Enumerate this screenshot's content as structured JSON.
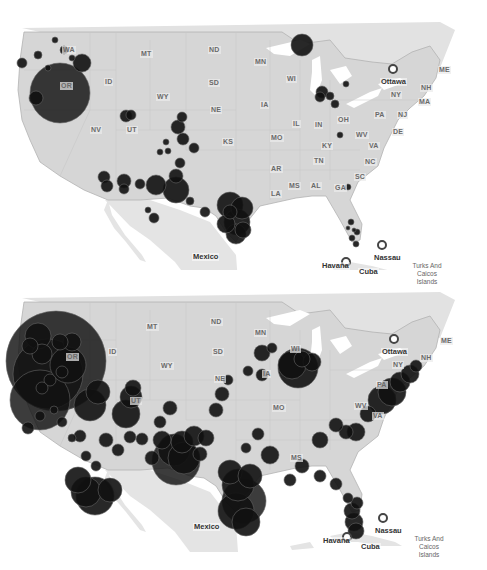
{
  "maps": [
    {
      "id": "top",
      "offset_y": 0,
      "state_labels": [
        {
          "text": "WA",
          "x": 62,
          "y": 46
        },
        {
          "text": "OR",
          "x": 60,
          "y": 82
        },
        {
          "text": "ID",
          "x": 104,
          "y": 78
        },
        {
          "text": "MT",
          "x": 140,
          "y": 50
        },
        {
          "text": "ND",
          "x": 208,
          "y": 46
        },
        {
          "text": "SD",
          "x": 208,
          "y": 79
        },
        {
          "text": "WY",
          "x": 156,
          "y": 93
        },
        {
          "text": "NE",
          "x": 210,
          "y": 106
        },
        {
          "text": "NV",
          "x": 90,
          "y": 126
        },
        {
          "text": "UT",
          "x": 126,
          "y": 126
        },
        {
          "text": "KS",
          "x": 222,
          "y": 138
        },
        {
          "text": "MN",
          "x": 254,
          "y": 58
        },
        {
          "text": "WI",
          "x": 286,
          "y": 75
        },
        {
          "text": "IA",
          "x": 260,
          "y": 101
        },
        {
          "text": "MO",
          "x": 270,
          "y": 134
        },
        {
          "text": "IL",
          "x": 292,
          "y": 120
        },
        {
          "text": "IN",
          "x": 314,
          "y": 121
        },
        {
          "text": "OH",
          "x": 337,
          "y": 116
        },
        {
          "text": "KY",
          "x": 321,
          "y": 142
        },
        {
          "text": "WV",
          "x": 355,
          "y": 131
        },
        {
          "text": "VA",
          "x": 368,
          "y": 142
        },
        {
          "text": "PA",
          "x": 374,
          "y": 111
        },
        {
          "text": "NY",
          "x": 390,
          "y": 91
        },
        {
          "text": "NJ",
          "x": 397,
          "y": 111
        },
        {
          "text": "DE",
          "x": 392,
          "y": 128
        },
        {
          "text": "NH",
          "x": 420,
          "y": 84
        },
        {
          "text": "MA",
          "x": 418,
          "y": 98
        },
        {
          "text": "ME",
          "x": 438,
          "y": 66
        },
        {
          "text": "TN",
          "x": 313,
          "y": 157
        },
        {
          "text": "NC",
          "x": 364,
          "y": 158
        },
        {
          "text": "AR",
          "x": 270,
          "y": 165
        },
        {
          "text": "SC",
          "x": 354,
          "y": 173
        },
        {
          "text": "MS",
          "x": 288,
          "y": 182
        },
        {
          "text": "AL",
          "x": 310,
          "y": 182
        },
        {
          "text": "GA",
          "x": 334,
          "y": 184
        },
        {
          "text": "LA",
          "x": 270,
          "y": 190
        }
      ],
      "places": [
        {
          "text": "Ottawa",
          "x": 380,
          "y": 78,
          "capital": true,
          "cx": 393,
          "cy": 69
        },
        {
          "text": "Mexico",
          "x": 192,
          "y": 253,
          "capital": false
        },
        {
          "text": "Nassau",
          "x": 373,
          "y": 254,
          "capital": true,
          "cx": 382,
          "cy": 245
        },
        {
          "text": "Havana",
          "x": 321,
          "y": 262,
          "capital": true,
          "cx": 346,
          "cy": 262
        },
        {
          "text": "Cuba",
          "x": 358,
          "y": 268,
          "capital": false
        }
      ],
      "note_label": {
        "text": "Turks And Caicos Islands",
        "x": 408,
        "y": 262
      }
    },
    {
      "id": "bottom",
      "offset_y": 290,
      "state_labels": [
        {
          "text": "MT",
          "x": 146,
          "y": 33
        },
        {
          "text": "ND",
          "x": 210,
          "y": 28
        },
        {
          "text": "SD",
          "x": 212,
          "y": 58
        },
        {
          "text": "ID",
          "x": 108,
          "y": 58
        },
        {
          "text": "OR",
          "x": 66,
          "y": 63
        },
        {
          "text": "WY",
          "x": 160,
          "y": 72
        },
        {
          "text": "NE",
          "x": 214,
          "y": 85
        },
        {
          "text": "UT",
          "x": 130,
          "y": 107
        },
        {
          "text": "MN",
          "x": 254,
          "y": 39
        },
        {
          "text": "WI",
          "x": 290,
          "y": 55
        },
        {
          "text": "IA",
          "x": 262,
          "y": 80
        },
        {
          "text": "MO",
          "x": 272,
          "y": 114
        },
        {
          "text": "NY",
          "x": 392,
          "y": 71
        },
        {
          "text": "PA",
          "x": 376,
          "y": 91
        },
        {
          "text": "WV",
          "x": 354,
          "y": 112
        },
        {
          "text": "VA",
          "x": 372,
          "y": 122
        },
        {
          "text": "NH",
          "x": 420,
          "y": 64
        },
        {
          "text": "ME",
          "x": 440,
          "y": 47
        },
        {
          "text": "MS",
          "x": 290,
          "y": 164
        }
      ],
      "places": [
        {
          "text": "Ottawa",
          "x": 381,
          "y": 58,
          "capital": true,
          "cx": 394,
          "cy": 49
        },
        {
          "text": "Mexico",
          "x": 193,
          "y": 233,
          "capital": false
        },
        {
          "text": "Nassau",
          "x": 374,
          "y": 237,
          "capital": true,
          "cx": 383,
          "cy": 228
        },
        {
          "text": "Havana",
          "x": 322,
          "y": 247,
          "capital": true,
          "cx": 347,
          "cy": 247
        },
        {
          "text": "Cuba",
          "x": 360,
          "y": 253,
          "capital": false
        }
      ],
      "note_label": {
        "text": "Turks And Caicos Islands",
        "x": 410,
        "y": 245
      }
    }
  ],
  "colors": {
    "land": "#d6d6d6",
    "land_outline": "#b3b3b3",
    "water": "#ffffff",
    "lakes_canada": "#e2e2e2",
    "mexico_land": "#e4e4e4",
    "bubble": "#111111",
    "bubble_stroke": "#666666"
  },
  "bubbles_top": [
    [
      60,
      93,
      30
    ],
    [
      82,
      63,
      9
    ],
    [
      36,
      98,
      7
    ],
    [
      22,
      63,
      5
    ],
    [
      38,
      55,
      4
    ],
    [
      64,
      50,
      4
    ],
    [
      48,
      68,
      3
    ],
    [
      72,
      58,
      3
    ],
    [
      55,
      40,
      3
    ],
    [
      104,
      177,
      6
    ],
    [
      107,
      186,
      6
    ],
    [
      124,
      181,
      7
    ],
    [
      124,
      189,
      5
    ],
    [
      140,
      184,
      5
    ],
    [
      156,
      185,
      10
    ],
    [
      176,
      190,
      13
    ],
    [
      176,
      176,
      7
    ],
    [
      180,
      163,
      5
    ],
    [
      178,
      127,
      7
    ],
    [
      182,
      117,
      5
    ],
    [
      183,
      139,
      6
    ],
    [
      194,
      148,
      5
    ],
    [
      131,
      115,
      5
    ],
    [
      126,
      116,
      6
    ],
    [
      230,
      205,
      13
    ],
    [
      242,
      208,
      11
    ],
    [
      237,
      222,
      13
    ],
    [
      236,
      234,
      10
    ],
    [
      226,
      224,
      9
    ],
    [
      243,
      230,
      8
    ],
    [
      230,
      212,
      7
    ],
    [
      302,
      45,
      11
    ],
    [
      320,
      97,
      5
    ],
    [
      322,
      92,
      6
    ],
    [
      330,
      96,
      4
    ],
    [
      335,
      104,
      4
    ],
    [
      346,
      84,
      3
    ],
    [
      340,
      135,
      3
    ],
    [
      348,
      187,
      3
    ],
    [
      351,
      222,
      3
    ],
    [
      357,
      232,
      3
    ],
    [
      352,
      238,
      3
    ],
    [
      356,
      244,
      3
    ],
    [
      348,
      228,
      2
    ],
    [
      354,
      230,
      2
    ],
    [
      166,
      142,
      3
    ],
    [
      168,
      151,
      3
    ],
    [
      160,
      152,
      3
    ],
    [
      190,
      201,
      4
    ],
    [
      205,
      212,
      5
    ],
    [
      154,
      218,
      5
    ],
    [
      148,
      210,
      3
    ]
  ],
  "bubbles_bottom": [
    [
      56,
      71,
      50
    ],
    [
      48,
      84,
      35
    ],
    [
      40,
      110,
      30
    ],
    [
      90,
      115,
      16
    ],
    [
      98,
      102,
      12
    ],
    [
      68,
      75,
      18
    ],
    [
      60,
      52,
      8
    ],
    [
      72,
      52,
      9
    ],
    [
      38,
      46,
      13
    ],
    [
      42,
      64,
      10
    ],
    [
      30,
      56,
      8
    ],
    [
      50,
      90,
      6
    ],
    [
      62,
      82,
      6
    ],
    [
      42,
      98,
      6
    ],
    [
      40,
      126,
      5
    ],
    [
      28,
      138,
      6
    ],
    [
      95,
      206,
      19
    ],
    [
      86,
      202,
      15
    ],
    [
      78,
      190,
      13
    ],
    [
      110,
      200,
      12
    ],
    [
      126,
      124,
      14
    ],
    [
      131,
      107,
      11
    ],
    [
      133,
      98,
      8
    ],
    [
      176,
      171,
      24
    ],
    [
      174,
      160,
      16
    ],
    [
      184,
      168,
      16
    ],
    [
      182,
      152,
      11
    ],
    [
      194,
      146,
      10
    ],
    [
      162,
      150,
      9
    ],
    [
      244,
      211,
      22
    ],
    [
      236,
      221,
      18
    ],
    [
      246,
      232,
      14
    ],
    [
      238,
      195,
      16
    ],
    [
      230,
      182,
      12
    ],
    [
      250,
      186,
      12
    ],
    [
      298,
      78,
      20
    ],
    [
      292,
      75,
      14
    ],
    [
      312,
      72,
      9
    ],
    [
      302,
      69,
      8
    ],
    [
      382,
      110,
      14
    ],
    [
      392,
      102,
      14
    ],
    [
      400,
      92,
      10
    ],
    [
      410,
      84,
      9
    ],
    [
      416,
      76,
      6
    ],
    [
      368,
      124,
      8
    ],
    [
      356,
      142,
      9
    ],
    [
      346,
      142,
      7
    ],
    [
      336,
      135,
      7
    ],
    [
      320,
      150,
      8
    ],
    [
      352,
      221,
      8
    ],
    [
      354,
      232,
      9
    ],
    [
      356,
      241,
      8
    ],
    [
      357,
      213,
      6
    ],
    [
      348,
      208,
      5
    ],
    [
      336,
      194,
      6
    ],
    [
      320,
      186,
      6
    ],
    [
      302,
      176,
      7
    ],
    [
      290,
      190,
      6
    ],
    [
      270,
      165,
      9
    ],
    [
      258,
      144,
      6
    ],
    [
      246,
      158,
      5
    ],
    [
      206,
      148,
      8
    ],
    [
      200,
      164,
      7
    ],
    [
      216,
      120,
      7
    ],
    [
      222,
      104,
      7
    ],
    [
      228,
      90,
      5
    ],
    [
      262,
      85,
      6
    ],
    [
      262,
      63,
      8
    ],
    [
      272,
      58,
      5
    ],
    [
      248,
      81,
      5
    ],
    [
      142,
      149,
      6
    ],
    [
      160,
      132,
      6
    ],
    [
      170,
      118,
      7
    ],
    [
      152,
      168,
      7
    ],
    [
      130,
      147,
      6
    ],
    [
      118,
      160,
      6
    ],
    [
      106,
      150,
      7
    ],
    [
      96,
      176,
      5
    ],
    [
      86,
      166,
      5
    ],
    [
      80,
      146,
      6
    ],
    [
      72,
      148,
      4
    ],
    [
      62,
      132,
      5
    ],
    [
      54,
      120,
      4
    ]
  ]
}
